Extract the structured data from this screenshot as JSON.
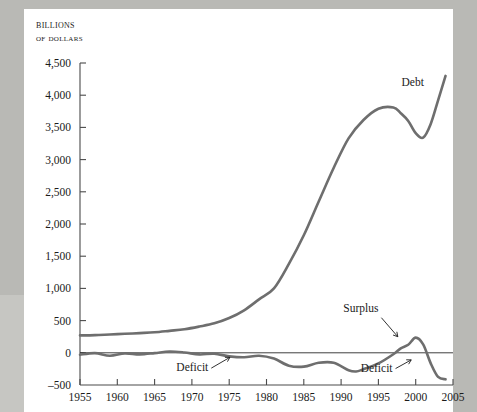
{
  "figure": {
    "axis_title_line1": "Billions",
    "axis_title_line2": "of dollars",
    "line_color": "#6e6e6e",
    "axis_color": "#4a4a4a",
    "page_background": "#b9b9b5",
    "sheet_background": "#ffffff"
  },
  "chart_data": {
    "type": "line",
    "title": "",
    "xlabel": "",
    "ylabel": "Billions of dollars",
    "xlim": [
      1955,
      2005
    ],
    "ylim": [
      -500,
      4500
    ],
    "xticks": [
      1955,
      1960,
      1965,
      1970,
      1975,
      1980,
      1985,
      1990,
      1995,
      2000,
      2005
    ],
    "yticks": [
      -500,
      0,
      500,
      1000,
      1500,
      2000,
      2500,
      3000,
      3500,
      4000,
      4500
    ],
    "ytick_labels": [
      "–500",
      "0",
      "500",
      "1,000",
      "1,500",
      "2,000",
      "2,500",
      "3,000",
      "3,500",
      "4,000",
      "4,500"
    ],
    "xtick_labels": [
      "1955",
      "1960",
      "1965",
      "1970",
      "1975",
      "1980",
      "1985",
      "1990",
      "1995",
      "2000",
      "2005"
    ],
    "grid": false,
    "legend": "none",
    "zero_line": true,
    "series": [
      {
        "name": "Debt",
        "x": [
          1955,
          1957,
          1959,
          1961,
          1963,
          1965,
          1967,
          1969,
          1971,
          1973,
          1975,
          1977,
          1979,
          1981,
          1983,
          1985,
          1987,
          1989,
          1991,
          1993,
          1995,
          1997,
          1998,
          1999,
          2000,
          2001,
          2002,
          2003,
          2004
        ],
        "values": [
          270,
          275,
          285,
          295,
          306,
          318,
          341,
          366,
          408,
          458,
          540,
          660,
          830,
          1000,
          1380,
          1825,
          2350,
          2870,
          3330,
          3615,
          3790,
          3810,
          3720,
          3600,
          3410,
          3340,
          3550,
          3920,
          4300
        ]
      },
      {
        "name": "Deficit / Surplus",
        "x": [
          1955,
          1957,
          1959,
          1961,
          1963,
          1965,
          1967,
          1969,
          1971,
          1973,
          1975,
          1977,
          1979,
          1981,
          1983,
          1985,
          1987,
          1989,
          1991,
          1992,
          1993,
          1995,
          1997,
          1998,
          1999,
          2000,
          2001,
          2002,
          2003,
          2004
        ],
        "values": [
          -30,
          -5,
          -45,
          -10,
          -25,
          -5,
          20,
          5,
          -25,
          -15,
          -55,
          -70,
          -45,
          -90,
          -200,
          -215,
          -155,
          -155,
          -270,
          -290,
          -255,
          -165,
          -22,
          70,
          125,
          235,
          130,
          -160,
          -375,
          -412
        ]
      }
    ],
    "annotations": [
      {
        "text": "Debt",
        "x": 1998.1,
        "y": 4140
      },
      {
        "text": "Surplus",
        "x": 1995.0,
        "y": 630
      },
      {
        "text": "Deficit",
        "x": 1972.2,
        "y": -285
      },
      {
        "text": "Deficit",
        "x": 1996.9,
        "y": -292
      }
    ]
  }
}
